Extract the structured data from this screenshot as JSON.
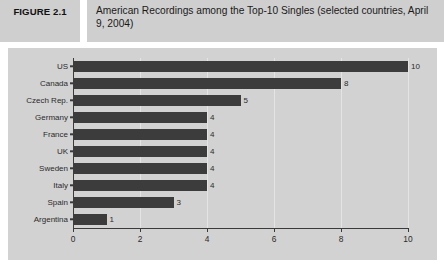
{
  "header": {
    "figure_label": "FIGURE 2.1",
    "title": "American Recordings among the Top-10 Singles (selected countries, April 9, 2004)"
  },
  "colors": {
    "header_band": "#cfcfcf",
    "panel_background": "#d2d2d2",
    "bar": "#3c3c3c",
    "axis": "#3a3a3a",
    "gridline": "#e8e8e8",
    "text": "#2b2b2b"
  },
  "chart_data": {
    "type": "bar",
    "orientation": "horizontal",
    "title": "American Recordings among the Top-10 Singles (selected countries, April 9, 2004)",
    "xlabel": "",
    "ylabel": "",
    "categories": [
      "US",
      "Canada",
      "Czech Rep.",
      "Germany",
      "France",
      "UK",
      "Sweden",
      "Italy",
      "Spain",
      "Argentina"
    ],
    "values": [
      10,
      8,
      5,
      4,
      4,
      4,
      4,
      4,
      3,
      1
    ],
    "value_labels": [
      "10",
      "8",
      "5",
      "4",
      "4",
      "4",
      "4",
      "4",
      "3",
      "1"
    ],
    "xlim": [
      0,
      10
    ],
    "xticks": [
      0,
      2,
      4,
      6,
      8,
      10
    ],
    "xtick_labels": [
      "0",
      "2",
      "4",
      "6",
      "8",
      "10"
    ],
    "gridlines": [
      2,
      4,
      6,
      8,
      10
    ],
    "grid": true,
    "legend": false
  }
}
